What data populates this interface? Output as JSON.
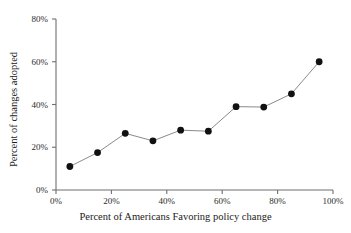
{
  "chart_data": {
    "type": "line",
    "title": "",
    "xlabel": "Percent of Americans Favoring policy change",
    "ylabel": "Percent of changes adopted",
    "x": [
      5,
      15,
      25,
      35,
      45,
      55,
      65,
      75,
      85,
      95
    ],
    "values": [
      11,
      17.5,
      26.5,
      23,
      28,
      27.5,
      39,
      38.8,
      45,
      60
    ],
    "series": [
      {
        "name": "Percent of changes adopted",
        "values": [
          11,
          17.5,
          26.5,
          23,
          28,
          27.5,
          39,
          38.8,
          45,
          60
        ]
      }
    ],
    "xlim": [
      0,
      100
    ],
    "ylim": [
      0,
      80
    ],
    "xticks": [
      0,
      20,
      40,
      60,
      80,
      100
    ],
    "yticks": [
      0,
      20,
      40,
      60,
      80
    ],
    "xtick_labels": [
      "0%",
      "20%",
      "40%",
      "60%",
      "80%",
      "100%"
    ],
    "ytick_labels": [
      "0%",
      "20%",
      "40%",
      "60%",
      "80%"
    ],
    "grid": false,
    "legend": "none",
    "marker": "circle",
    "marker_color": "#111111",
    "line_color": "#8a8a8a",
    "background_color": "#ffffff"
  }
}
